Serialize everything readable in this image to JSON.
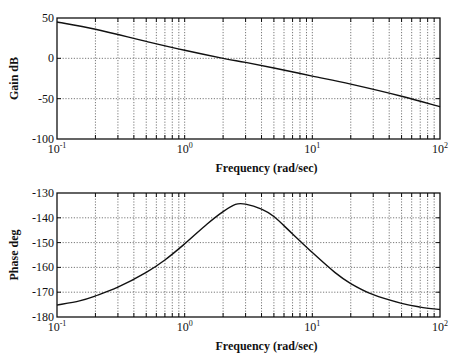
{
  "chart_data": [
    {
      "type": "line",
      "title": "",
      "xlabel": "Frequency (rad/sec)",
      "ylabel": "Gain dB",
      "xscale": "log",
      "xlim": [
        0.1,
        100
      ],
      "ylim": [
        -100,
        50
      ],
      "yticks": [
        50,
        0,
        -50,
        -100
      ],
      "ytick_labels": [
        "50",
        "0",
        "-50",
        "-100"
      ],
      "xtick_labels": [
        {
          "base": "10",
          "exp": "-1"
        },
        {
          "base": "10",
          "exp": "0"
        },
        {
          "base": "10",
          "exp": "1"
        },
        {
          "base": "10",
          "exp": "2"
        }
      ],
      "grid": true,
      "series": [
        {
          "name": "Gain",
          "x": [
            0.1,
            0.2,
            0.5,
            1,
            2,
            3,
            5,
            10,
            20,
            50,
            100
          ],
          "values": [
            45,
            36,
            21,
            10,
            0,
            -5,
            -12,
            -22,
            -32,
            -47,
            -60
          ]
        }
      ]
    },
    {
      "type": "line",
      "title": "",
      "xlabel": "Frequency (rad/sec)",
      "ylabel": "Phase deg",
      "xscale": "log",
      "xlim": [
        0.1,
        100
      ],
      "ylim": [
        -180,
        -130
      ],
      "yticks": [
        -130,
        -140,
        -150,
        -160,
        -170,
        -180
      ],
      "ytick_labels": [
        "-130",
        "-140",
        "-150",
        "-160",
        "-170",
        "-180"
      ],
      "xtick_labels": [
        {
          "base": "10",
          "exp": "-1"
        },
        {
          "base": "10",
          "exp": "0"
        },
        {
          "base": "10",
          "exp": "1"
        },
        {
          "base": "10",
          "exp": "2"
        }
      ],
      "grid": true,
      "series": [
        {
          "name": "Phase",
          "x": [
            0.1,
            0.15,
            0.2,
            0.3,
            0.5,
            0.7,
            1,
            1.5,
            2,
            2.5,
            3,
            4,
            5,
            7,
            10,
            15,
            20,
            30,
            50,
            70,
            100
          ],
          "values": [
            -175.2,
            -173.5,
            -171.5,
            -168,
            -162,
            -157,
            -150.5,
            -142.5,
            -137.5,
            -134.6,
            -134.5,
            -136.5,
            -139.5,
            -146.5,
            -154,
            -162,
            -166.5,
            -171,
            -174.5,
            -176,
            -177
          ]
        }
      ]
    }
  ],
  "plots": {
    "gain": {
      "ylabel": "Gain dB",
      "xlabel": "Frequency (rad/sec)"
    },
    "phase": {
      "ylabel": "Phase deg",
      "xlabel": "Frequency (rad/sec)"
    }
  }
}
